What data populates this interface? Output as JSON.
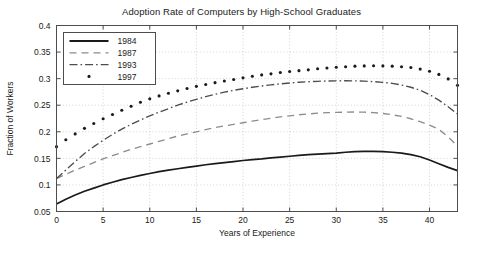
{
  "chart_data": {
    "type": "line",
    "title": "Adoption Rate of Computers by High-School Graduates",
    "xlabel": "Years of Experience",
    "ylabel": "Fraction of Workers",
    "xlim": [
      0,
      43
    ],
    "ylim": [
      0.05,
      0.4
    ],
    "xticks": [
      0,
      5,
      10,
      15,
      20,
      25,
      30,
      35,
      40
    ],
    "yticks": [
      0.05,
      0.1,
      0.15,
      0.2,
      0.25,
      0.3,
      0.35,
      0.4
    ],
    "xtick_labels": [
      "0",
      "5",
      "10",
      "15",
      "20",
      "25",
      "30",
      "35",
      "40"
    ],
    "ytick_labels": [
      "0.05",
      "0.1",
      "0.15",
      "0.2",
      "0.25",
      "0.3",
      "0.35",
      "0.4"
    ],
    "grid": true,
    "legend_position": "top-left",
    "x": [
      0,
      1,
      2,
      3,
      4,
      5,
      6,
      7,
      8,
      9,
      10,
      11,
      12,
      13,
      14,
      15,
      16,
      17,
      18,
      19,
      20,
      21,
      22,
      23,
      24,
      25,
      26,
      27,
      28,
      29,
      30,
      31,
      32,
      33,
      34,
      35,
      36,
      37,
      38,
      39,
      40,
      41,
      42,
      43
    ],
    "series": [
      {
        "name": "1984",
        "style": "solid",
        "color": "#1a1a1a",
        "values": [
          0.064,
          0.073,
          0.081,
          0.088,
          0.094,
          0.1,
          0.105,
          0.11,
          0.114,
          0.118,
          0.1215,
          0.125,
          0.128,
          0.1305,
          0.133,
          0.1355,
          0.138,
          0.14,
          0.142,
          0.144,
          0.146,
          0.1475,
          0.149,
          0.151,
          0.1525,
          0.154,
          0.1555,
          0.157,
          0.158,
          0.159,
          0.16,
          0.1615,
          0.1625,
          0.163,
          0.163,
          0.1625,
          0.1615,
          0.16,
          0.157,
          0.153,
          0.147,
          0.14,
          0.133,
          0.127
        ]
      },
      {
        "name": "1987",
        "style": "dashed",
        "color": "#8c8c8c",
        "values": [
          0.112,
          0.12,
          0.128,
          0.135,
          0.142,
          0.149,
          0.155,
          0.161,
          0.167,
          0.172,
          0.177,
          0.182,
          0.187,
          0.192,
          0.196,
          0.2,
          0.204,
          0.208,
          0.211,
          0.214,
          0.217,
          0.22,
          0.223,
          0.2255,
          0.228,
          0.23,
          0.232,
          0.2335,
          0.235,
          0.236,
          0.2365,
          0.237,
          0.2372,
          0.237,
          0.236,
          0.2345,
          0.232,
          0.229,
          0.2245,
          0.219,
          0.2125,
          0.2045,
          0.1905,
          0.173
        ]
      },
      {
        "name": "1993",
        "style": "dashdot",
        "color": "#4d4d4d",
        "values": [
          0.112,
          0.128,
          0.144,
          0.159,
          0.172,
          0.184,
          0.195,
          0.205,
          0.214,
          0.222,
          0.23,
          0.237,
          0.2435,
          0.25,
          0.256,
          0.261,
          0.266,
          0.2705,
          0.2745,
          0.278,
          0.281,
          0.2838,
          0.2862,
          0.2884,
          0.2902,
          0.2918,
          0.2932,
          0.2942,
          0.295,
          0.2956,
          0.2959,
          0.296,
          0.2958,
          0.2953,
          0.2944,
          0.293,
          0.291,
          0.288,
          0.2838,
          0.278,
          0.27,
          0.2595,
          0.247,
          0.2335
        ]
      },
      {
        "name": "1997",
        "style": "dotted-markers",
        "color": "#1a1a1a",
        "values": [
          0.172,
          0.185,
          0.196,
          0.2065,
          0.2155,
          0.2245,
          0.2325,
          0.2405,
          0.248,
          0.2555,
          0.262,
          0.2675,
          0.2725,
          0.277,
          0.2815,
          0.2855,
          0.289,
          0.2925,
          0.2955,
          0.2985,
          0.3015,
          0.3045,
          0.307,
          0.309,
          0.3115,
          0.3135,
          0.315,
          0.3165,
          0.3185,
          0.32,
          0.3215,
          0.3225,
          0.3235,
          0.324,
          0.3242,
          0.324,
          0.3235,
          0.3225,
          0.321,
          0.318,
          0.314,
          0.308,
          0.2995,
          0.2875
        ]
      }
    ]
  },
  "legend": {
    "entries": [
      {
        "label": "1984"
      },
      {
        "label": "1987"
      },
      {
        "label": "1993"
      },
      {
        "label": "1997"
      }
    ]
  }
}
